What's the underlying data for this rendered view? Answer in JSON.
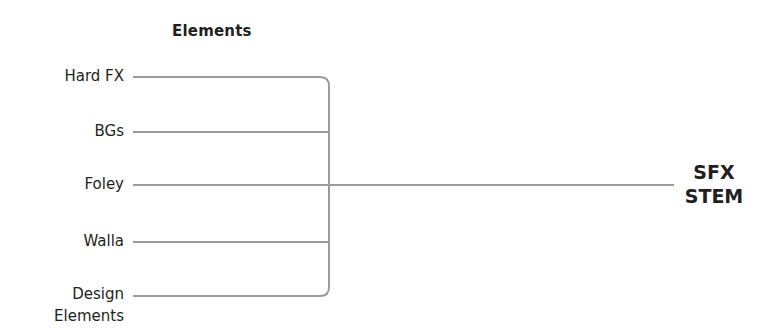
{
  "diagram": {
    "title": "Elements",
    "inputs": [
      {
        "label": "Hard FX",
        "y": 77
      },
      {
        "label": "BGs",
        "y": 132
      },
      {
        "label": "Foley",
        "y": 185
      },
      {
        "label": "Walla",
        "y": 242
      },
      {
        "label": "Design",
        "label2": "Elements",
        "y": 296
      }
    ],
    "output": {
      "line1": "SFX",
      "line2": "STEM"
    },
    "colors": {
      "line": "#9a9a9a",
      "text": "#231f20"
    }
  }
}
